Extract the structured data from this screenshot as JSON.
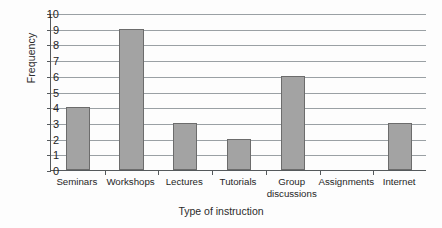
{
  "chart_data": {
    "type": "bar",
    "title": "",
    "xlabel": "Type of instruction",
    "ylabel": "Frequency",
    "categories": [
      "Seminars",
      "Workshops",
      "Lectures",
      "Tutorials",
      "Group discussions",
      "Assignments",
      "Internet"
    ],
    "values": [
      4,
      9,
      3,
      2,
      6,
      0,
      3
    ],
    "ylim": [
      0,
      10
    ],
    "yticks": [
      0,
      1,
      2,
      3,
      4,
      5,
      6,
      7,
      8,
      9,
      10
    ],
    "ytick_labels": [
      "0",
      "1",
      "2",
      "3",
      "4",
      "5",
      "6",
      "7",
      "8",
      "9",
      "10"
    ],
    "grid": "horizontal",
    "legend": "none",
    "bar_color": "#a3a3a3",
    "bar_edge_color": "#6c6c6c",
    "axis_color": "#55595c",
    "gridline_color": "#9aa0a4",
    "category_label_lines": [
      [
        "Seminars"
      ],
      [
        "Workshops"
      ],
      [
        "Lectures"
      ],
      [
        "Tutorials"
      ],
      [
        "Group",
        "discussions"
      ],
      [
        "Assignments"
      ],
      [
        "Internet"
      ]
    ]
  }
}
